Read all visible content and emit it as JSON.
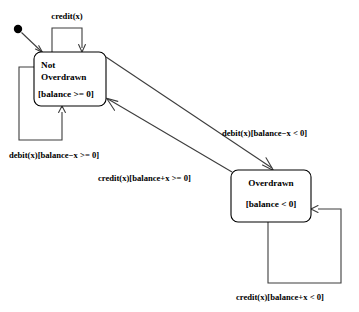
{
  "diagram": {
    "type": "uml-state-machine",
    "background_color": "#ffffff",
    "line_color": "#3d3d3d",
    "box_stroke_color": "#000000",
    "text_color": "#000000"
  },
  "initial_state": {
    "name": "initial-pseudostate",
    "shape": "filled-circle",
    "cx": 18,
    "cy": 29,
    "r": 4.2,
    "target": "Not Overdrawn"
  },
  "states": [
    {
      "id": "not-overdrawn",
      "name_line1": "Not",
      "name_line2": "Overdrawn",
      "guard": "[balance >= 0]",
      "x": 34,
      "y": 52,
      "width": 72,
      "height": 54,
      "rx": 7
    },
    {
      "id": "overdrawn",
      "name_line1": "Overdrawn",
      "name_line2": "",
      "guard": "[balance < 0]",
      "x": 231,
      "y": 170,
      "width": 80,
      "height": 52,
      "rx": 7
    }
  ],
  "transitions": [
    {
      "id": "credit-self-not-overdrawn",
      "label": "credit(x)",
      "from": "not-overdrawn",
      "to": "not-overdrawn",
      "kind": "self-loop-top",
      "label_x": 67,
      "label_y": 16
    },
    {
      "id": "debit-self-not-overdrawn",
      "label": "debit(x)[balance−x >= 0]",
      "from": "not-overdrawn",
      "to": "not-overdrawn",
      "kind": "self-loop-left-bottom",
      "label_x": 9,
      "label_y": 158
    },
    {
      "id": "debit-to-overdrawn",
      "label": "debit(x)[balance−x < 0]",
      "from": "not-overdrawn",
      "to": "overdrawn",
      "kind": "diagonal",
      "label_x": 222,
      "label_y": 133
    },
    {
      "id": "credit-to-not-overdrawn",
      "label": "credit(x)[balance+x >= 0]",
      "from": "overdrawn",
      "to": "not-overdrawn",
      "kind": "diagonal",
      "label_x": 98,
      "label_y": 178
    },
    {
      "id": "credit-self-overdrawn",
      "label": "credit(x)[balance+x < 0]",
      "from": "overdrawn",
      "to": "overdrawn",
      "kind": "self-loop-bottom-right",
      "label_x": 236,
      "label_y": 297
    }
  ]
}
